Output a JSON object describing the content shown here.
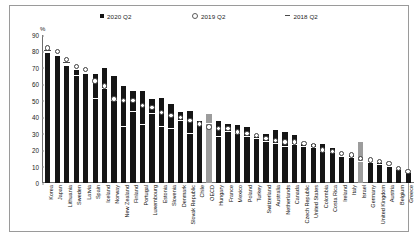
{
  "legend": {
    "items": [
      {
        "label": "2020 Q2",
        "marker": "filled-square-icon",
        "color": "#141414"
      },
      {
        "label": "2019 Q2",
        "marker": "open-circle-icon",
        "color": "#ffffff"
      },
      {
        "label": "2018 Q2",
        "marker": "dash-icon",
        "color": "#4a4a4a"
      }
    ]
  },
  "chart_data": {
    "type": "bar",
    "title": "",
    "xlabel": "",
    "ylabel": "%",
    "ylim": [
      0,
      90
    ],
    "yticks": [
      0,
      10,
      20,
      30,
      40,
      50,
      60,
      70,
      80,
      90
    ],
    "grid": false,
    "legend_position": "top",
    "highlight_categories": [
      "OECD",
      "Israel"
    ],
    "highlight_color": "#9c9c9c",
    "bar_color": "#151515",
    "categories": [
      "Korea",
      "Japan",
      "Lithuania",
      "Sweden",
      "Latvia",
      "Spain",
      "Iceland",
      "Norway",
      "New Zealand",
      "Finland",
      "Portugal",
      "Luxembourg",
      "Estonia",
      "Slovenia",
      "Denmark",
      "Slovak Republic",
      "Chile",
      "OECD",
      "Hungary",
      "France",
      "Mexico",
      "Poland",
      "Turkey",
      "Switzerland",
      "Australia",
      "Netherlands",
      "Canada",
      "Czech Republic",
      "United States",
      "Colombia",
      "Costa Rica",
      "Ireland",
      "Italy",
      "Israel",
      "Germany",
      "United Kingdom",
      "Austria",
      "Belgium",
      "Greece"
    ],
    "series": [
      {
        "name": "2020 Q2",
        "marker": "bar",
        "values": [
          79,
          77,
          71,
          69,
          66,
          66,
          70,
          65,
          59,
          56,
          56,
          51,
          52,
          48,
          43,
          44,
          38,
          42,
          38,
          36,
          35,
          34,
          28,
          30,
          32,
          31,
          29,
          24,
          24,
          24,
          21,
          16,
          17,
          25,
          13,
          12,
          10,
          8,
          6
        ]
      },
      {
        "name": "2019 Q2",
        "marker": "circle",
        "values": [
          82,
          80,
          75,
          71,
          69,
          62,
          59,
          51,
          50,
          50,
          47,
          46,
          43,
          41,
          40,
          38,
          36,
          34,
          33,
          33,
          31,
          30,
          29,
          27,
          26,
          25,
          25,
          24,
          23,
          20,
          19,
          18,
          17,
          15,
          14,
          13,
          12,
          9,
          7
        ]
      },
      {
        "name": "2018 Q2",
        "marker": "dash",
        "values": [
          80,
          77,
          73,
          65,
          66,
          51,
          57,
          50,
          34,
          43,
          35,
          42,
          34,
          33,
          38,
          30,
          35,
          36,
          28,
          31,
          30,
          28,
          27,
          25,
          24,
          22,
          23,
          22,
          21,
          19,
          18,
          16,
          15,
          13,
          12,
          11,
          10,
          8,
          6
        ]
      }
    ]
  }
}
